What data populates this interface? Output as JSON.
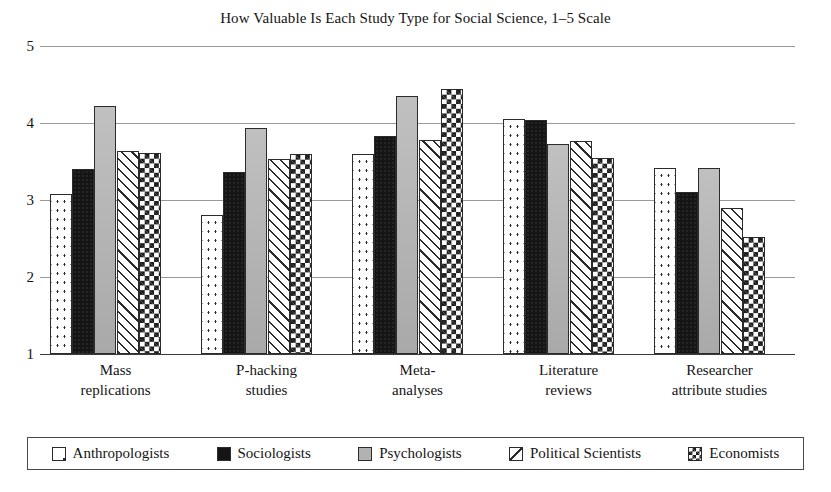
{
  "chart_data": {
    "type": "bar",
    "title": "How Valuable Is Each Study Type for Social Science, 1–5 Scale",
    "xlabel": "",
    "ylabel": "",
    "ylim": [
      1,
      5
    ],
    "yticks": [
      1,
      2,
      3,
      4,
      5
    ],
    "ytick_labels": [
      "1",
      "2",
      "3",
      "4",
      "5"
    ],
    "grid": true,
    "legend_position": "bottom",
    "categories": [
      "Mass replications",
      "P-hacking studies",
      "Meta-analyses",
      "Literature reviews",
      "Researcher attribute studies"
    ],
    "category_lines": [
      [
        "Mass",
        "replications"
      ],
      [
        "P-hacking",
        "studies"
      ],
      [
        "Meta-",
        "analyses"
      ],
      [
        "Literature",
        "reviews"
      ],
      [
        "Researcher",
        "attribute studies"
      ]
    ],
    "series": [
      {
        "name": "Anthropologists",
        "pattern": "dots",
        "values": [
          3.08,
          2.81,
          3.6,
          4.05,
          3.42
        ]
      },
      {
        "name": "Sociologists",
        "pattern": "solid-black",
        "values": [
          3.4,
          3.36,
          3.83,
          4.04,
          3.1
        ]
      },
      {
        "name": "Psychologists",
        "pattern": "gray",
        "values": [
          4.22,
          3.94,
          4.35,
          3.73,
          3.41
        ]
      },
      {
        "name": "Political Scientists",
        "pattern": "diagonal-hatch",
        "values": [
          3.64,
          3.53,
          3.78,
          3.76,
          2.89
        ]
      },
      {
        "name": "Economists",
        "pattern": "checkerboard",
        "values": [
          3.61,
          3.6,
          4.44,
          3.54,
          2.52
        ]
      }
    ]
  },
  "legend": {
    "items": [
      {
        "label": "Anthropologists",
        "swatch": "dots-swatch-icon"
      },
      {
        "label": "Sociologists",
        "swatch": "black-swatch-icon"
      },
      {
        "label": "Psychologists",
        "swatch": "gray-swatch-icon"
      },
      {
        "label": "Political Scientists",
        "swatch": "diagonal-swatch-icon"
      },
      {
        "label": "Economists",
        "swatch": "checker-swatch-icon"
      }
    ]
  },
  "colors": {
    "background": "#ffffff",
    "text": "#141414",
    "gridline": "#9a9a9a",
    "axis": "#3a3a3a",
    "bar_outline": "#2b2b2b",
    "series_black": "#151515",
    "series_gray": "#b2b2b2"
  }
}
